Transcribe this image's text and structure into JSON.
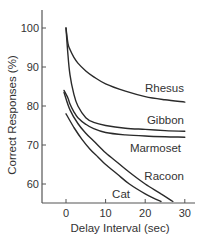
{
  "chart_data": {
    "type": "line",
    "title": "",
    "xlabel": "Delay Interval (sec)",
    "ylabel": "Correct Responses (%)",
    "xlim": [
      -6,
      32
    ],
    "ylim": [
      54,
      104
    ],
    "xticks": [
      0,
      10,
      20,
      30
    ],
    "yticks": [
      60,
      70,
      80,
      90,
      100
    ],
    "grid": false,
    "legend": "inline labels at line ends",
    "series": [
      {
        "name": "Rhesus",
        "x": [
          0,
          0.5,
          1,
          2,
          3,
          5,
          7,
          10,
          15,
          20,
          25,
          30
        ],
        "y": [
          100,
          96,
          94.5,
          92.5,
          91,
          89,
          87.5,
          85.7,
          83.8,
          82.4,
          81.6,
          81
        ]
      },
      {
        "name": "Gibbon",
        "x": [
          0,
          0.5,
          1,
          2,
          3,
          5,
          7,
          10,
          15,
          20,
          25,
          30
        ],
        "y": [
          100,
          93,
          88,
          83,
          80,
          77,
          75.8,
          75,
          74.3,
          74,
          73.7,
          73.5
        ]
      },
      {
        "name": "Marmoset",
        "x": [
          -0.5,
          0.5,
          1,
          2,
          3,
          5,
          7,
          10,
          15,
          20,
          25,
          30
        ],
        "y": [
          84,
          82,
          80.5,
          78.5,
          77,
          75.3,
          74.2,
          73.2,
          72.6,
          72.3,
          72.1,
          72
        ]
      },
      {
        "name": "Racoon",
        "x": [
          -0.5,
          1,
          3,
          5,
          7,
          10,
          13,
          16,
          20,
          24,
          27
        ],
        "y": [
          83.5,
          79,
          75.5,
          73,
          71,
          68,
          65.5,
          63,
          60,
          57.5,
          55.5
        ]
      },
      {
        "name": "Cat",
        "x": [
          0,
          2,
          4,
          6,
          8,
          10,
          13,
          16,
          20,
          24
        ],
        "y": [
          78,
          74.5,
          71.5,
          69,
          67,
          65,
          62.5,
          60,
          57.5,
          55.5
        ]
      }
    ],
    "labels": {
      "Rhesus": "Rhesus",
      "Gibbon": "Gibbon",
      "Marmoset": "Marmoset",
      "Racoon": "Racoon",
      "Cat": "Cat"
    }
  },
  "axis_labels": {
    "x": "Delay Interval (sec)",
    "y": "Correct Responses (%)"
  }
}
